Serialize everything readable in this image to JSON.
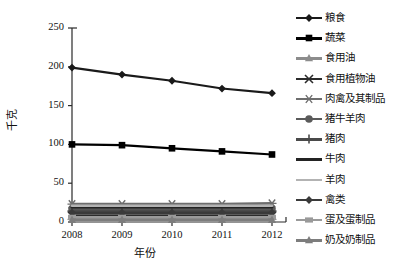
{
  "chart_data": {
    "type": "line",
    "title": "",
    "xlabel": "年份",
    "ylabel": "千克",
    "categories": [
      "2008",
      "2009",
      "2010",
      "2011",
      "2012"
    ],
    "x_ticks": [
      "2008",
      "2009",
      "2010",
      "2011",
      "2012"
    ],
    "y_ticks": [
      "0",
      "50",
      "100",
      "150",
      "200",
      "250"
    ],
    "ylim": [
      0,
      250
    ],
    "grid": false,
    "legend_position": "right",
    "series": [
      {
        "name": "粮食",
        "values": [
          199,
          190,
          182,
          172,
          166
        ],
        "color": "#1a1a1a",
        "marker": "diamond",
        "key_line": "#1a1a1a"
      },
      {
        "name": "蔬菜",
        "values": [
          100,
          99,
          95,
          91,
          87
        ],
        "color": "#000000",
        "marker": "square",
        "key_line": "#000000"
      },
      {
        "name": "食用油",
        "values": [
          9,
          9,
          9,
          9,
          9
        ],
        "color": "#8c8c8c",
        "marker": "tri",
        "key_line": "#8c8c8c"
      },
      {
        "name": "食用植物油",
        "values": [
          8,
          8,
          8,
          8,
          8
        ],
        "color": "#2b2b2b",
        "marker": "x",
        "key_line": "#2b2b2b"
      },
      {
        "name": "肉禽及其制品",
        "values": [
          23,
          23,
          23,
          23,
          24
        ],
        "color": "#6e6e6e",
        "marker": "star",
        "key_line": "#6e6e6e"
      },
      {
        "name": "猪牛羊肉",
        "values": [
          17,
          17,
          17,
          17,
          17
        ],
        "color": "#5a5a5a",
        "marker": "circle",
        "key_line": "#5a5a5a"
      },
      {
        "name": "猪肉",
        "values": [
          14,
          14,
          14,
          14,
          14
        ],
        "color": "#4a4a4a",
        "marker": "plus",
        "key_line": "#4a4a4a"
      },
      {
        "name": "牛肉",
        "values": [
          19,
          19,
          19,
          19,
          19
        ],
        "color": "#232323",
        "marker": "none",
        "key_line": "#232323"
      },
      {
        "name": "羊肉",
        "values": [
          21,
          21,
          21,
          21,
          21
        ],
        "color": "#b3b3b3",
        "marker": "none",
        "key_line": "#b3b3b3"
      },
      {
        "name": "禽类",
        "values": [
          12,
          12,
          12,
          12,
          12
        ],
        "color": "#3a3a3a",
        "marker": "diamond",
        "key_line": "#3a3a3a"
      },
      {
        "name": "蛋及蛋制品",
        "values": [
          6,
          6,
          6,
          6,
          6
        ],
        "color": "#9a9a9a",
        "marker": "rect",
        "key_line": "#9a9a9a"
      },
      {
        "name": "奶及奶制品",
        "values": [
          3,
          3,
          3,
          3,
          3
        ],
        "color": "#7d7d7d",
        "marker": "tri",
        "key_line": "#7d7d7d"
      }
    ]
  }
}
